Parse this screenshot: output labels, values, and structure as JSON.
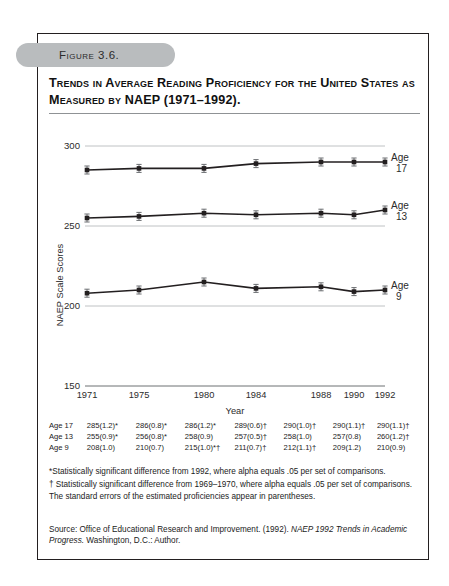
{
  "figure": {
    "badge_label": "Figure 3.6.",
    "title": "Trends in Average Reading Proficiency for the United States as Measured by NAEP (1971–1992)."
  },
  "chart_data": {
    "type": "line",
    "title": "Trends in Average Reading Proficiency for the United States as Measured by NAEP (1971–1992).",
    "xlabel": "Year",
    "ylabel": "NAEP Scale Scores",
    "x": [
      1971,
      1975,
      1980,
      1984,
      1988,
      1990,
      1992
    ],
    "categories": [
      "1971",
      "1975",
      "1980",
      "1984",
      "1988",
      "1990",
      "1992"
    ],
    "ylim": [
      150,
      300
    ],
    "yticks": [
      150,
      200,
      250,
      300
    ],
    "ytick_labels": [
      "150",
      "200",
      "250",
      "300"
    ],
    "grid": true,
    "legend_position": "right-inline",
    "series": [
      {
        "name": "Age 17",
        "label_line1": "Age",
        "label_line2": "17",
        "values": [
          285,
          286,
          286,
          289,
          290,
          290,
          290
        ],
        "errors": [
          1.2,
          0.8,
          1.2,
          0.6,
          1.0,
          1.1,
          1.1
        ]
      },
      {
        "name": "Age 13",
        "label_line1": "Age",
        "label_line2": "13",
        "values": [
          255,
          256,
          258,
          257,
          258,
          257,
          260
        ],
        "errors": [
          0.9,
          0.8,
          0.9,
          0.5,
          1.0,
          0.8,
          1.2
        ]
      },
      {
        "name": "Age 9",
        "label_line1": "Age",
        "label_line2": "9",
        "values": [
          208,
          210,
          215,
          211,
          212,
          209,
          210
        ],
        "errors": [
          1.0,
          0.7,
          1.0,
          0.7,
          1.1,
          1.2,
          0.9
        ]
      }
    ]
  },
  "table": {
    "rows": [
      {
        "label": "Age 17",
        "cells": [
          "285(1.2)*",
          "286(0.8)*",
          "286(1.2)*",
          "289(0.6)†",
          "290(1.0)†",
          "290(1.1)†",
          "290(1.1)†"
        ]
      },
      {
        "label": "Age 13",
        "cells": [
          "255(0.9)*",
          "256(0.8)*",
          "258(0.9)",
          "257(0.5)†",
          "258(1.0)",
          "257(0.8)",
          "260(1.2)†"
        ]
      },
      {
        "label": "Age 9",
        "cells": [
          "208(1.0)",
          "210(0.7)",
          "215(1.0)*†",
          "211(0.7)†",
          "212(1.1)†",
          "209(1.2)",
          "210(0.9)"
        ]
      }
    ]
  },
  "notes": {
    "note_asterisk": "*Statistically significant difference from 1992, where alpha equals .05 per set of comparisons.",
    "note_dagger": "† Statistically significant difference from 1969–1970, where alpha equals .05 per set of comparisons. The standard errors of the estimated proficiencies appear in parentheses."
  },
  "source": {
    "prefix": "Source: Office of Educational Research and Improvement. (1992). ",
    "italic": "NAEP 1992 Trends in Academic Progress.",
    "suffix": " Washington, D.C.: Author."
  },
  "colors": {
    "badge": "#b9bcbe",
    "frame": "#231f20",
    "line": "#231f20",
    "grid": "#bfc2c4",
    "text": "#1b1b1b"
  }
}
